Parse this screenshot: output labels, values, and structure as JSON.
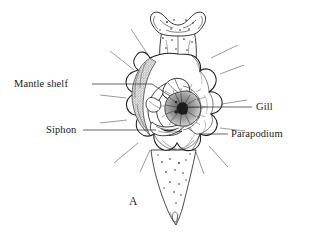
{
  "figure": {
    "caption_letter": "A",
    "background_color": "#ffffff",
    "ink_color": "#1d1d1d",
    "labels": [
      {
        "id": "mantle-shelf",
        "text": "Mantle shelf",
        "side": "left",
        "text_x": 14,
        "text_y": 87,
        "leader": "M92,84 L152,84 L170,96"
      },
      {
        "id": "siphon",
        "text": "Siphon",
        "side": "left",
        "text_x": 46,
        "text_y": 133,
        "leader": "M83,130 L156,130"
      },
      {
        "id": "gill",
        "text": "Gill",
        "side": "right",
        "text_x": 256,
        "text_y": 110,
        "leader": "M252,107 L186,107"
      },
      {
        "id": "parapodium",
        "text": "Parapodium",
        "side": "right",
        "text_x": 231,
        "text_y": 137,
        "leader": "M228,134 L196,134 L188,128"
      }
    ]
  }
}
